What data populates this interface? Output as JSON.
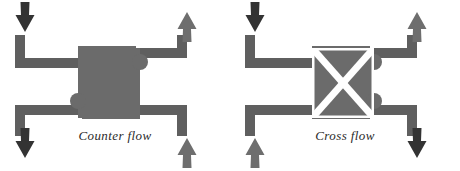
{
  "figure": {
    "background_color": "#ffffff",
    "width": 460,
    "height": 171
  },
  "palette": {
    "dark_arrow": "#333333",
    "light_arrow": "#6e6e6e",
    "pipe": "#5f5f5f",
    "block": "#6b6b6b",
    "block_pattern": "#ffffff",
    "caption_text": "#2b2b2b"
  },
  "diagrams": [
    {
      "id": "counter-flow",
      "caption": "Counter flow",
      "block_label": "",
      "block_pattern": "solid",
      "ports": [
        {
          "name": "top-left-inlet",
          "position": "top-left",
          "direction": "down",
          "tone": "dark"
        },
        {
          "name": "top-right-outlet",
          "position": "top-right",
          "direction": "up",
          "tone": "light"
        },
        {
          "name": "bottom-left-outlet",
          "position": "bottom-left",
          "direction": "down",
          "tone": "dark"
        },
        {
          "name": "bottom-right-inlet",
          "position": "bottom-right",
          "direction": "up",
          "tone": "light"
        }
      ]
    },
    {
      "id": "cross-flow",
      "caption": "Cross flow",
      "block_label": "",
      "block_pattern": "cross",
      "ports": [
        {
          "name": "top-left-inlet",
          "position": "top-left",
          "direction": "down",
          "tone": "dark"
        },
        {
          "name": "top-right-outlet",
          "position": "top-right",
          "direction": "up",
          "tone": "light"
        },
        {
          "name": "bottom-left-inlet",
          "position": "bottom-left",
          "direction": "up",
          "tone": "light"
        },
        {
          "name": "bottom-right-outlet",
          "position": "bottom-right",
          "direction": "down",
          "tone": "dark"
        }
      ]
    }
  ]
}
